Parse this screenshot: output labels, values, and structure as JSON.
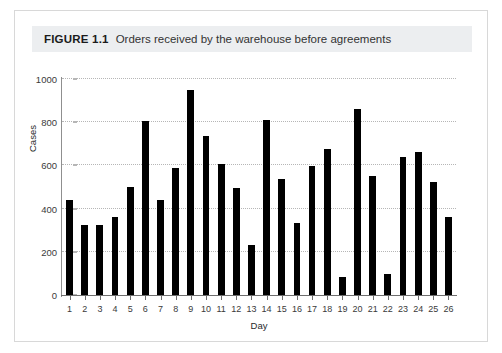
{
  "caption": {
    "label": "FIGURE 1.1",
    "text": "Orders received by the warehouse before agreements"
  },
  "colors": {
    "bar": "#000000",
    "grid": "#b6b6b6",
    "axis": "#6e6e6e",
    "caption_band": "#eceef0",
    "card_border": "#d8d8d8",
    "page_background": "#ffffff"
  },
  "chart_data": {
    "type": "bar",
    "title": "Orders received by the warehouse before agreements",
    "xlabel": "Day",
    "ylabel": "Cases",
    "categories": [
      "1",
      "2",
      "3",
      "4",
      "5",
      "6",
      "7",
      "8",
      "9",
      "10",
      "11",
      "12",
      "13",
      "14",
      "15",
      "16",
      "17",
      "18",
      "19",
      "20",
      "21",
      "22",
      "23",
      "24",
      "25",
      "26"
    ],
    "values": [
      440,
      325,
      325,
      360,
      500,
      805,
      440,
      590,
      950,
      735,
      605,
      495,
      230,
      810,
      535,
      335,
      595,
      675,
      85,
      860,
      550,
      95,
      640,
      660,
      525,
      360
    ],
    "ylim": [
      0,
      1000
    ],
    "yticks": [
      0,
      200,
      400,
      600,
      800,
      1000
    ],
    "ytick_labels": [
      "0",
      "200",
      "400",
      "600",
      "800",
      "1000"
    ],
    "grid": true,
    "grid_axis": "y",
    "legend": null
  }
}
